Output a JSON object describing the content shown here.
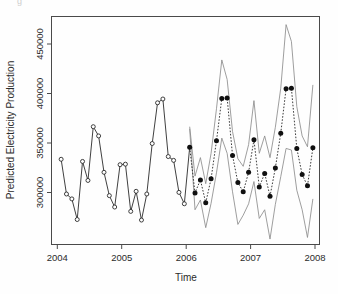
{
  "chart_data": {
    "type": "line",
    "title": "",
    "xlabel": "Time",
    "ylabel": "Predicted Electricity Production",
    "xlim": [
      2003.85,
      2008.02
    ],
    "ylim": [
      268000,
      478000
    ],
    "xticks": [
      2004,
      2005,
      2006,
      2007,
      2008
    ],
    "xticklabels": [
      "2004",
      "2005",
      "2006",
      "2007",
      "2008"
    ],
    "yticks": [
      300000,
      350000,
      400000,
      450000
    ],
    "yticklabels": [
      "300000",
      "350000",
      "400000",
      "450000"
    ],
    "grid": false,
    "legend": "none",
    "series": [
      {
        "name": "Observed",
        "style": "solid-line-open-circles",
        "marker": "open-circle",
        "color": "#2a2a2a",
        "x": [
          2004.0,
          2004.083,
          2004.167,
          2004.25,
          2004.333,
          2004.417,
          2004.5,
          2004.583,
          2004.667,
          2004.75,
          2004.833,
          2004.917,
          2005.0,
          2005.083,
          2005.167,
          2005.25,
          2005.333,
          2005.417,
          2005.5,
          2005.583,
          2005.667,
          2005.75,
          2005.833,
          2005.917
        ],
        "values": [
          346500,
          314500,
          310000,
          291000,
          344500,
          327000,
          376500,
          368000,
          334500,
          313000,
          302500,
          341500,
          342000,
          298500,
          317000,
          290500,
          314500,
          361000,
          398500,
          402000,
          349000,
          345500,
          316000,
          305500
        ]
      },
      {
        "name": "Forecast",
        "style": "dotted-line-filled-circles",
        "marker": "filled-circle",
        "color": "#101010",
        "x": [
          2006.0,
          2006.083,
          2006.167,
          2006.25,
          2006.333,
          2006.417,
          2006.5,
          2006.583,
          2006.667,
          2006.75,
          2006.833,
          2006.917,
          2007.0,
          2007.083,
          2007.167,
          2007.25,
          2007.333,
          2007.417,
          2007.5,
          2007.583,
          2007.667,
          2007.75,
          2007.833,
          2007.917
        ],
        "values": [
          357500,
          315500,
          327500,
          306500,
          328500,
          363500,
          402500,
          403000,
          350000,
          325000,
          316500,
          334500,
          364500,
          321000,
          333500,
          312500,
          338500,
          370500,
          411500,
          412000,
          356500,
          332500,
          322000,
          357000
        ]
      },
      {
        "name": "Upper prediction interval",
        "style": "thin-gray-line",
        "marker": "none",
        "color": "#8d8d8d",
        "x": [
          2006.0,
          2006.083,
          2006.167,
          2006.25,
          2006.333,
          2006.417,
          2006.5,
          2006.583,
          2006.667,
          2006.75,
          2006.833,
          2006.917,
          2007.0,
          2007.083,
          2007.167,
          2007.25,
          2007.333,
          2007.417,
          2007.5,
          2007.583,
          2007.667,
          2007.75,
          2007.833,
          2007.917
        ],
        "values": [
          376500,
          331000,
          348000,
          324000,
          352000,
          393000,
          438000,
          420000,
          372000,
          347000,
          340000,
          360000,
          400500,
          352000,
          368000,
          348000,
          376000,
          412000,
          470500,
          455000,
          395000,
          368000,
          358000,
          415000
        ]
      },
      {
        "name": "Lower prediction interval",
        "style": "thin-gray-line",
        "marker": "none",
        "color": "#8d8d8d",
        "x": [
          2006.0,
          2006.083,
          2006.167,
          2006.25,
          2006.333,
          2006.417,
          2006.5,
          2006.583,
          2006.667,
          2006.75,
          2006.833,
          2006.917,
          2007.0,
          2007.083,
          2007.167,
          2007.25,
          2007.333,
          2007.417,
          2007.5,
          2007.583,
          2007.667,
          2007.75,
          2007.833,
          2007.917
        ],
        "values": [
          374500,
          300000,
          309000,
          283500,
          306000,
          334000,
          366000,
          352000,
          316500,
          286500,
          295000,
          305500,
          326000,
          292000,
          300000,
          273000,
          305000,
          330500,
          356500,
          355000,
          318000,
          300000,
          274500,
          310000
        ]
      }
    ]
  },
  "axes": {
    "y_title": "Predicted Electricity Production",
    "x_title": "Time"
  }
}
